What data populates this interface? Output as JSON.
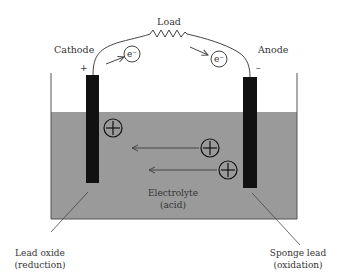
{
  "labels": {
    "load": "Load",
    "cathode": "Cathode",
    "anode": "Anode",
    "cathode_sign": "+",
    "anode_sign": "–",
    "electron_left": "e⁻",
    "electron_right": "e⁻",
    "electrolyte_line1": "Electrolyte",
    "electrolyte_line2": "(acid)",
    "lead_oxide_line1": "Lead oxide",
    "lead_oxide_line2": "(reduction)",
    "sponge_lead_line1": "Sponge lead",
    "sponge_lead_line2": "(oxidation)"
  },
  "ions": [
    {
      "symbol": "+",
      "cx": 113,
      "cy": 128
    },
    {
      "symbol": "+",
      "cx": 210,
      "cy": 148
    },
    {
      "symbol": "+",
      "cx": 228,
      "cy": 170
    }
  ],
  "colors": {
    "electrolyte": "#9a9a9a",
    "electrode": "#111111",
    "line": "#444444",
    "text": "#333333"
  }
}
